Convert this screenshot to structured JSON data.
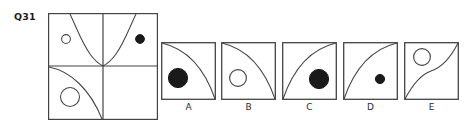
{
  "question": {
    "label": "Q31",
    "type": "abstract-reasoning-matrix"
  },
  "colors": {
    "stroke": "#444444",
    "fill_dot": "#1a1a1a",
    "background": "#ffffff",
    "text": "#2b2b2b"
  },
  "matrix": {
    "rows": 2,
    "cols": 2,
    "cells": [
      {
        "position": "top-left",
        "curve": "s-curve-down",
        "shape": "small-hollow-circle",
        "shape_position": "left"
      },
      {
        "position": "top-right",
        "curve": "s-curve-up",
        "shape": "small-filled-dot",
        "shape_position": "right"
      },
      {
        "position": "bottom-left",
        "curve": "convex-arc",
        "shape": "large-hollow-circle",
        "shape_position": "lower-left"
      },
      {
        "position": "bottom-right",
        "curve": "none",
        "shape": "none",
        "shape_position": "none"
      }
    ]
  },
  "options": [
    {
      "label": "A",
      "curve": "convex-arc-down",
      "shape": "large-filled-dot"
    },
    {
      "label": "B",
      "curve": "convex-arc-down",
      "shape": "medium-hollow-circle"
    },
    {
      "label": "C",
      "curve": "concave-arc-up",
      "shape": "large-filled-dot"
    },
    {
      "label": "D",
      "curve": "concave-arc-up",
      "shape": "small-filled-dot"
    },
    {
      "label": "E",
      "curve": "s-curve",
      "shape": "medium-hollow-circle"
    }
  ]
}
